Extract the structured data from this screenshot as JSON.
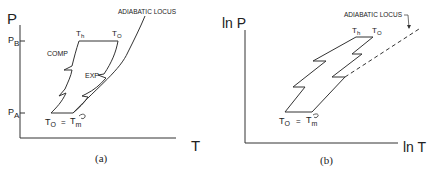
{
  "panel_a": {
    "caption": "(a)",
    "y_axis_label": "P",
    "x_axis_label": "T",
    "tick_high": "P",
    "tick_high_sub": "B",
    "tick_low": "P",
    "tick_low_sub": "A",
    "curve_label": "ADIABATIC LOCUS",
    "comp_label": "COMP",
    "exp_label": "EXP",
    "top_left_label": "T",
    "top_left_sub": "h",
    "top_right_label": "T",
    "top_right_sub": "O",
    "bottom_left_label": "T",
    "bottom_left_sub": "O",
    "equals": "=",
    "bottom_right_label": "T",
    "bottom_right_sub": "m"
  },
  "panel_b": {
    "caption": "(b)",
    "y_axis_label": "ln P",
    "x_axis_label": "ln T",
    "curve_label": "ADIABATIC LOCUS",
    "top_left_label": "T",
    "top_left_sub": "h",
    "top_right_label": "T",
    "top_right_sub": "O",
    "bottom_left_label": "T",
    "bottom_left_sub": "O",
    "equals": "=",
    "bottom_right_label": "T",
    "bottom_right_sub": "m"
  },
  "colors": {
    "line": "#333333",
    "background": "#ffffff"
  }
}
